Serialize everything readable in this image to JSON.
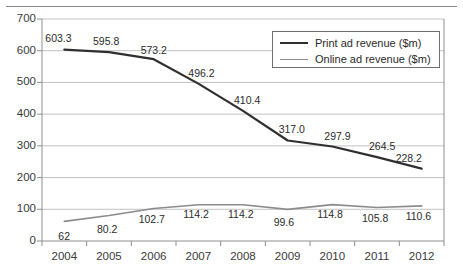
{
  "figure": {
    "top_rule": "",
    "title_fragment": ""
  },
  "chart_data": {
    "type": "line",
    "title": "",
    "xlabel": "",
    "ylabel": "",
    "categories": [
      "2004",
      "2005",
      "2006",
      "2007",
      "2008",
      "2009",
      "2010",
      "2011",
      "2012"
    ],
    "series": [
      {
        "name": "Print ad revenue ($m)",
        "color": "#2f2f2f",
        "values": [
          603.3,
          595.8,
          573.2,
          496.2,
          410.4,
          317.0,
          297.9,
          264.5,
          228.2
        ],
        "labels": [
          "603.3",
          "595.8",
          "573.2",
          "496.2",
          "410.4",
          "317.0",
          "297.9",
          "264.5",
          "228.2"
        ]
      },
      {
        "name": "Online ad revenue ($m)",
        "color": "#8c8c8c",
        "values": [
          62,
          80.2,
          102.7,
          114.2,
          114.2,
          99.6,
          114.8,
          105.8,
          110.6
        ],
        "labels": [
          "62",
          "80.2",
          "102.7",
          "114.2",
          "114.2",
          "99.6",
          "114.8",
          "105.8",
          "110.6"
        ]
      }
    ],
    "ylim": [
      0,
      700
    ],
    "yticks": [
      0,
      100,
      200,
      300,
      400,
      500,
      600,
      700
    ],
    "ytick_labels": [
      "0",
      "100",
      "200",
      "300",
      "400",
      "500",
      "600",
      "700"
    ],
    "grid": "horizontal",
    "legend_position": "top-right"
  },
  "legend": {
    "entries": [
      {
        "label": "Print ad revenue ($m)"
      },
      {
        "label": "Online ad revenue ($m)"
      }
    ]
  }
}
